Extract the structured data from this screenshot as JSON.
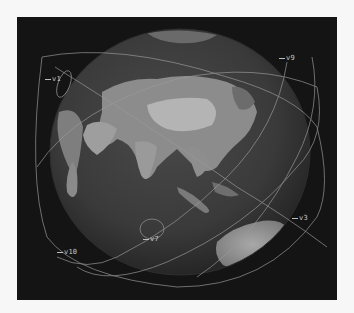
{
  "view": {
    "type": "3d-globe-orbit-viewer",
    "background": "#141414",
    "page_background": "#f7f7f7",
    "globe": {
      "center_region": "Asia / Indian Ocean",
      "visible_landmasses": [
        "Asia",
        "Arabian Peninsula",
        "East Africa",
        "India",
        "Southeast Asia",
        "Indonesia",
        "Australia",
        "Arctic ice"
      ],
      "tone": "grayscale"
    },
    "orbit_color": "#a8a8a8"
  },
  "satellites": [
    {
      "id": "v1",
      "label": "v1"
    },
    {
      "id": "v9",
      "label": "v9"
    },
    {
      "id": "v3",
      "label": "v3"
    },
    {
      "id": "v10",
      "label": "v10"
    },
    {
      "id": "v7",
      "label": "v7"
    }
  ]
}
